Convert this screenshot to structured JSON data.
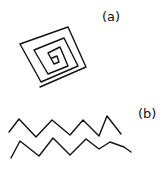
{
  "figure": {
    "panels": [
      {
        "id": "a",
        "label": "(a)",
        "description": "hand-drawn square spiral"
      },
      {
        "id": "b",
        "label": "(b)",
        "description": "two parallel hand-drawn zigzag lines"
      }
    ],
    "stroke_color": "#111111",
    "background": "#ffffff"
  }
}
